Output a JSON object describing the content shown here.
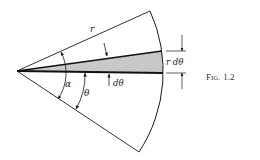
{
  "figure": {
    "caption": "Fig. 1.2",
    "caption_display": "F",
    "caption_small": "IG.",
    "caption_number": "1.2"
  },
  "labels": {
    "radius": "r",
    "alpha": "α",
    "theta": "θ",
    "dtheta": "dθ",
    "strip_width": "r dθ"
  },
  "colors": {
    "line": "#1a1a1a",
    "strip_fill": "#c8c8c8",
    "background": "#ffffff"
  }
}
